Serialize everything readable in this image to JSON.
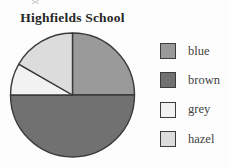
{
  "page": {
    "background_color": "#fdfdfd"
  },
  "chart_data": {
    "type": "pie",
    "title": "Highfields School",
    "categories": [
      "blue",
      "brown",
      "grey",
      "hazel"
    ],
    "values_percent": [
      25,
      50,
      8.3,
      16.7
    ],
    "approx_fractions": [
      "1/4",
      "1/2",
      "1/12",
      "1/6"
    ],
    "order": "clockwise from 12 o'clock: blue, brown, grey, hazel",
    "colors": {
      "blue": "#9a9a9a",
      "brown": "#717171",
      "grey": "#f2f2f2",
      "hazel": "#dcdcdc"
    },
    "outline_color": "#3a3a3a",
    "legend_position": "right",
    "legend_labels": [
      "blue",
      "brown",
      "grey",
      "hazel"
    ]
  }
}
